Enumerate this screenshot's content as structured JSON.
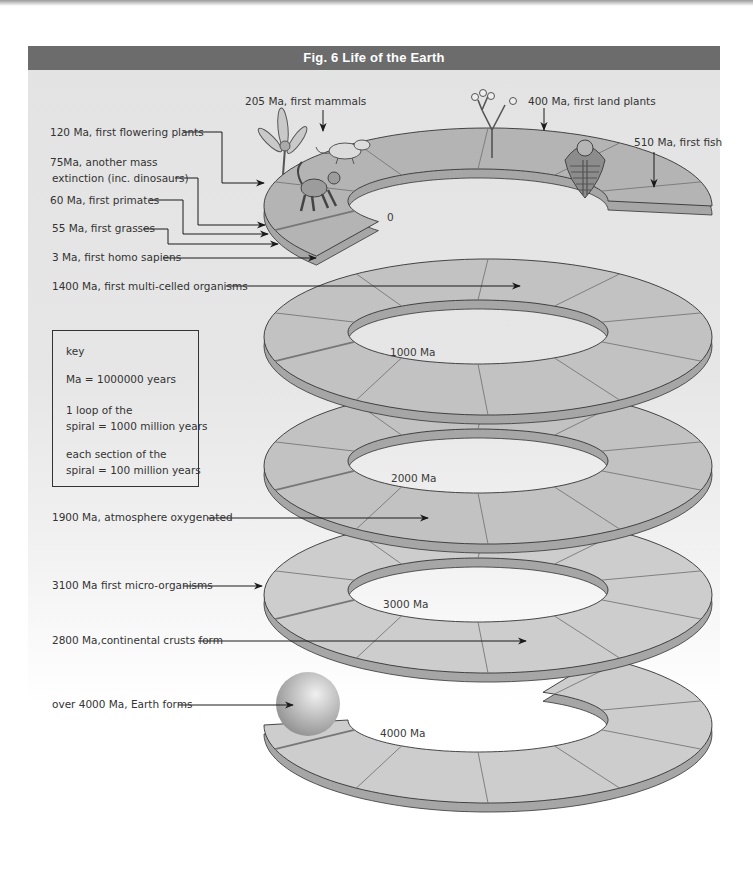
{
  "figure": {
    "title": "Fig. 6 Life of the Earth"
  },
  "events": {
    "mammals": "205 Ma, first mammals",
    "land_plants": "400 Ma, first land plants",
    "fish": "510 Ma, first fish",
    "flowering_plants": "120 Ma, first flowering plants",
    "extinction_line1": "75Ma, another mass",
    "extinction_line2": "extinction (inc. dinosaurs)",
    "primates": "60  Ma, first primates",
    "grasses": "55 Ma, first grasses",
    "homo_sapiens": "3 Ma, first homo sapiens",
    "multi_celled": "1400 Ma, first multi-celled organisms",
    "oxygenated": "1900 Ma, atmosphere oxygenated",
    "micro_organisms": "3100 Ma first micro-organisms",
    "continental_crusts": "2800 Ma,continental crusts form",
    "earth_forms": "over 4000 Ma, Earth forms"
  },
  "key": {
    "heading": "key",
    "ma_def": "Ma = 1000000 years",
    "loop_line1": "1 loop of the",
    "loop_line2": "spiral = 1000 million years",
    "section_line1": "each section of the",
    "section_line2": "spiral = 100 million years"
  },
  "spiral_markers": {
    "start": "0",
    "loop1": "1000 Ma",
    "loop2": "2000 Ma",
    "loop3": "3000 Ma",
    "loop4": "4000 Ma"
  },
  "colors": {
    "title_bar": "#6c6c6c",
    "ring_dark": "#b4b4b4",
    "ring_mid": "#c2c2c2",
    "ring_light": "#cdcdcd",
    "ring_side": "#a6a6a6",
    "panel_bg": "#e5e5e5"
  }
}
